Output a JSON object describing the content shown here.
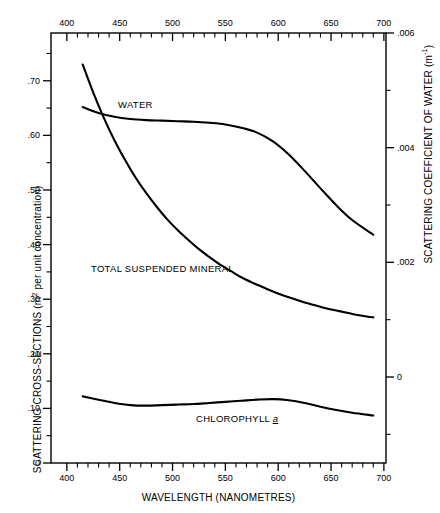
{
  "chart_data": {
    "type": "line",
    "title": "",
    "xlabel": "WAVELENGTH (NANOMETRES)",
    "ylabel": "SCATTERING CROSS-SECTIONS (m² per unit concentration)",
    "ylabel_left_main": "SCATTERING CROSS-SECTIONS  (m",
    "ylabel_left_sup": "2",
    "ylabel_left_tail": " per unit concentration)",
    "ylabel_right_main": "SCATTERING COEFFICIENT OF WATER  (m",
    "ylabel_right_sup": "-1",
    "ylabel_right_tail": ")",
    "y2label": "SCATTERING COEFFICIENT OF WATER (m⁻¹)",
    "xlim": [
      385,
      702
    ],
    "ylim": [
      0.0,
      0.7875
    ],
    "y2lim": [
      -0.0015,
      0.006
    ],
    "grid": false,
    "legend": "inline-curve-labels",
    "x_ticks_major": [
      400,
      450,
      500,
      550,
      600,
      650,
      700
    ],
    "x_tick_labels": [
      "400",
      "450",
      "500",
      "550",
      "600",
      "650",
      "700"
    ],
    "x_ticks_minor_step": 10,
    "y_left_ticks_major": [
      0,
      0.1,
      0.2,
      0.3,
      0.4,
      0.5,
      0.6,
      0.7
    ],
    "y_left_tick_labels": [
      "0",
      ".10",
      ".20",
      ".30",
      ".40",
      ".50",
      ".60",
      ".70"
    ],
    "y_left_minor_step": 0.05,
    "y_right_ticks_major": [
      0,
      0.002,
      0.004,
      0.006
    ],
    "y_right_tick_labels": [
      "0",
      ".002",
      ".004",
      ".006"
    ],
    "y_right_minor_step": 0.001,
    "series": [
      {
        "name": "WATER",
        "label": "WATER",
        "axis": "right",
        "units": "m^-1",
        "points": [
          [
            415,
            0.00545
          ],
          [
            425,
            0.00496
          ],
          [
            435,
            0.00452
          ],
          [
            445,
            0.00413
          ],
          [
            455,
            0.00379
          ],
          [
            465,
            0.00348
          ],
          [
            475,
            0.00321
          ],
          [
            485,
            0.00297
          ],
          [
            495,
            0.00275
          ],
          [
            505,
            0.00256
          ],
          [
            515,
            0.00239
          ],
          [
            525,
            0.00223
          ],
          [
            535,
            0.00209
          ],
          [
            545,
            0.00196
          ],
          [
            555,
            0.00185
          ],
          [
            565,
            0.00174
          ],
          [
            575,
            0.00165
          ],
          [
            585,
            0.00157
          ],
          [
            595,
            0.00149
          ],
          [
            605,
            0.00142
          ],
          [
            615,
            0.00136
          ],
          [
            625,
            0.0013
          ],
          [
            635,
            0.00125
          ],
          [
            645,
            0.0012
          ],
          [
            655,
            0.00116
          ],
          [
            665,
            0.00112
          ],
          [
            675,
            0.00108
          ],
          [
            685,
            0.00105
          ],
          [
            690,
            0.00104
          ]
        ]
      },
      {
        "name": "TOTAL SUSPENDED MINERAL",
        "label": "TOTAL SUSPENDED MINERAL",
        "axis": "left",
        "units": "m^2 per unit concentration",
        "points": [
          [
            415,
            0.652
          ],
          [
            430,
            0.641
          ],
          [
            445,
            0.634
          ],
          [
            460,
            0.63
          ],
          [
            475,
            0.628
          ],
          [
            490,
            0.627
          ],
          [
            505,
            0.626
          ],
          [
            520,
            0.625
          ],
          [
            535,
            0.623
          ],
          [
            550,
            0.62
          ],
          [
            565,
            0.614
          ],
          [
            580,
            0.605
          ],
          [
            595,
            0.589
          ],
          [
            610,
            0.565
          ],
          [
            625,
            0.535
          ],
          [
            640,
            0.503
          ],
          [
            655,
            0.472
          ],
          [
            670,
            0.445
          ],
          [
            690,
            0.418
          ]
        ]
      },
      {
        "name": "CHLOROPHYLL a",
        "label_main": "CHLOROPHYLL ",
        "label_italic": "a",
        "axis": "left",
        "units": "m^2 per unit concentration",
        "points": [
          [
            415,
            0.122
          ],
          [
            430,
            0.116
          ],
          [
            445,
            0.11
          ],
          [
            460,
            0.106
          ],
          [
            475,
            0.105
          ],
          [
            490,
            0.106
          ],
          [
            505,
            0.107
          ],
          [
            520,
            0.108
          ],
          [
            535,
            0.11
          ],
          [
            550,
            0.112
          ],
          [
            565,
            0.114
          ],
          [
            580,
            0.116
          ],
          [
            595,
            0.117
          ],
          [
            610,
            0.115
          ],
          [
            625,
            0.11
          ],
          [
            640,
            0.103
          ],
          [
            655,
            0.097
          ],
          [
            670,
            0.092
          ],
          [
            690,
            0.087
          ]
        ]
      }
    ]
  }
}
